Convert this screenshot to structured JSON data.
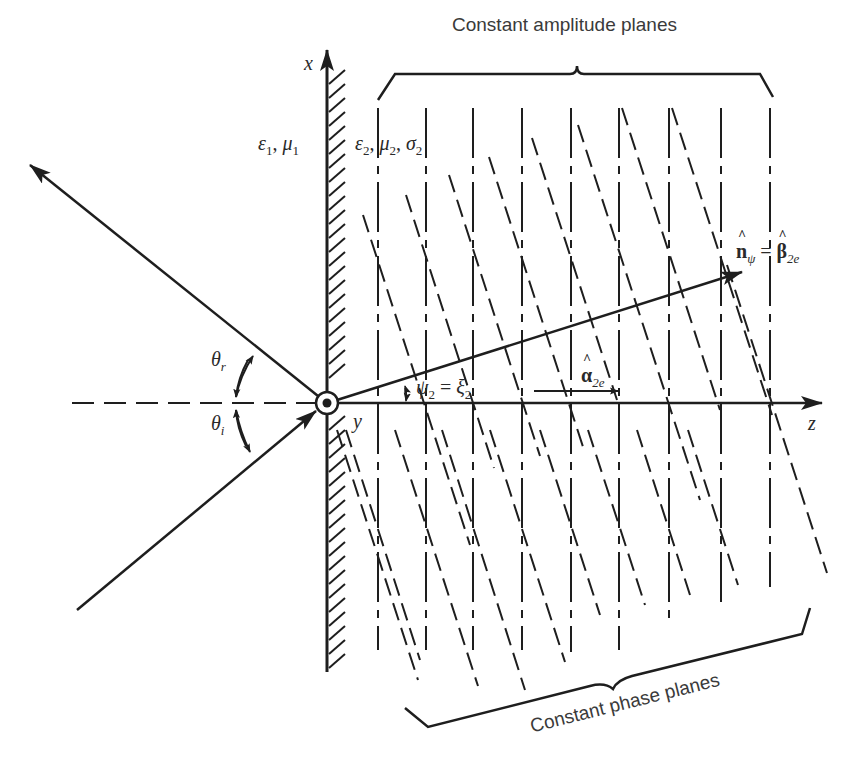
{
  "figure": {
    "type": "oblique-incidence-lossy-medium-diagram",
    "colors": {
      "line": "#1e1e1e",
      "text": "#2a2a2a",
      "background": "#ffffff"
    },
    "axes": {
      "x_label": "x",
      "y_label": "y",
      "z_label": "z"
    },
    "media": {
      "medium1": {
        "eps": "ε",
        "eps_sub": "1",
        "mu": "μ",
        "mu_sub": "1",
        "sep": ", "
      },
      "medium2": {
        "eps": "ε",
        "eps_sub": "2",
        "mu": "μ",
        "mu_sub": "2",
        "sigma": "σ",
        "sigma_sub": "2",
        "sep": ", "
      }
    },
    "angles": {
      "reflected": {
        "symbol": "θ",
        "sub": "r"
      },
      "incident": {
        "symbol": "θ",
        "sub": "i"
      },
      "transmitted": {
        "lhs": "ψ",
        "lhs_sub": "2",
        "eq": " = ",
        "rhs": "ξ",
        "rhs_sub": "2"
      }
    },
    "vectors": {
      "phase_direction": {
        "lhs": "n",
        "lhs_sub": "ψ",
        "eq": " = ",
        "rhs": "β",
        "rhs_sub": "2e"
      },
      "attenuation_direction": {
        "symbol": "α",
        "sub": "2e"
      }
    },
    "annotations": {
      "top_brace": "Constant amplitude planes",
      "bottom_brace": "Constant phase planes"
    },
    "geometry": {
      "origin": [
        327,
        403
      ],
      "constant_amplitude_plane_x": [
        378,
        426,
        473,
        522,
        571,
        619,
        669,
        721,
        770
      ],
      "phase_plane_axis_crossings_x": [
        330,
        378,
        426,
        473,
        522,
        571,
        619,
        669,
        721,
        770
      ],
      "transmission_angle_deg": 17.5
    }
  }
}
